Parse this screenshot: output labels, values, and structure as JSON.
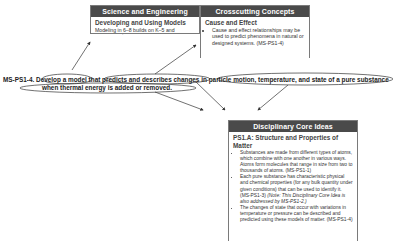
{
  "science_engineering_practices": {
    "header": "Science and Engineering Practices",
    "subheading": "Developing and Using Models",
    "body_cut": "Modeling in 6–8 builds on K–5 and progresses to"
  },
  "crosscutting_concepts": {
    "header": "Crosscutting Concepts",
    "subheading": "Cause and Effect",
    "bullets": [
      "Cause and effect relationships may be used to predict phenomena in natural or designed systems. (MS-PS1-4)"
    ]
  },
  "performance_expectation": {
    "code": "MS-PS1-4.",
    "line1_parts": [
      "Develop a model",
      " that ",
      "predicts and describes changes",
      " in ",
      "particle motion, temperature, and state of a pure substance"
    ],
    "line2": "when thermal energy is added or removed."
  },
  "disciplinary_core_ideas": {
    "header": "Disciplinary Core Ideas",
    "subheading": "PS1.A: Structure and Properties of Matter",
    "bullets": [
      {
        "text": "Substances are made from different types of atoms, which combine with one another in various ways. Atoms form molecules that range in size from two to thousands of atoms. (MS-PS1-1)",
        "note": ""
      },
      {
        "text": "Each pure substance has characteristic physical and chemical properties (for any bulk quantity under given conditions) that can be used to identify it. (MS-PS1-3) ",
        "note": "(Note: This Disciplinary Core Idea is also addressed by MS-PS1-2.)"
      },
      {
        "text": "The changes of state that occur with variations in temperature or pressure can be described and predicted using these models of matter. (MS-PS1-4)",
        "note": ""
      }
    ]
  },
  "colors": {
    "header_bg": "#4a4a4a",
    "header_text": "#ffffff",
    "border": "#7a7a7a",
    "arrow": "#333333"
  }
}
